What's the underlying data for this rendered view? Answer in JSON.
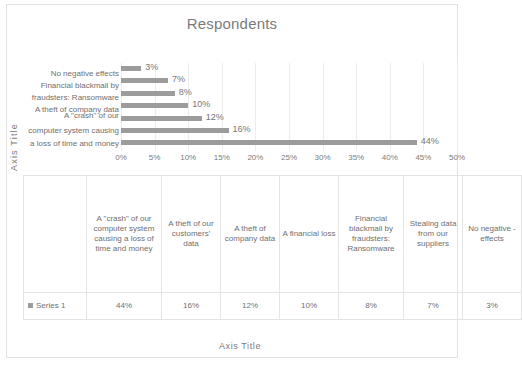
{
  "chart_data": {
    "type": "bar",
    "orientation": "horizontal",
    "title": "Respondents",
    "xlabel": "Axis Title",
    "ylabel": "Axis Title",
    "xlim": [
      0,
      50
    ],
    "grid": true,
    "legend_position": "table-left",
    "series_name": "Series 1",
    "categories": [
      "A \"crash\" of our computer system causing a loss of time and money",
      "A theft of our customers' data",
      "A theft of company data",
      "A financial loss",
      "Financial blackmail by fraudsters: Ransomware",
      "Stealing data from our suppliers",
      "No negative effects"
    ],
    "values": [
      44,
      16,
      12,
      10,
      8,
      7,
      3
    ],
    "value_labels": [
      "44%",
      "16%",
      "12%",
      "10%",
      "8%",
      "7%",
      "3%"
    ],
    "tick_labels": [
      "0%",
      "5%",
      "10%",
      "15%",
      "20%",
      "25%",
      "30%",
      "35%",
      "40%",
      "45%",
      "50%"
    ],
    "tick_values": [
      0,
      5,
      10,
      15,
      20,
      25,
      30,
      35,
      40,
      45,
      50
    ],
    "bar_color": "#9c9c9c",
    "grid_color": "#ededed",
    "text_color": "#6f6f6f"
  },
  "chart": {
    "title": "Respondents",
    "y_axis_title": "Axis Title",
    "x_axis_title": "Axis Title",
    "axis_label_lines": [
      "No negative effects",
      "Financial blackmail by",
      "fraudsters: Ransomware",
      "A theft of company data",
      "A \"crash\" of our",
      "computer system causing",
      "a loss of time and money"
    ],
    "bars": [
      {
        "label": "3%",
        "value": 3
      },
      {
        "label": "7%",
        "value": 7
      },
      {
        "label": "8%",
        "value": 8
      },
      {
        "label": "10%",
        "value": 10
      },
      {
        "label": "12%",
        "value": 12
      },
      {
        "label": "16%",
        "value": 16
      },
      {
        "label": "44%",
        "value": 44
      }
    ],
    "ticks": [
      "0%",
      "5%",
      "10%",
      "15%",
      "20%",
      "25%",
      "30%",
      "35%",
      "40%",
      "45%",
      "50%"
    ]
  },
  "table": {
    "legend_label": "Series 1",
    "headers": [
      "A \"crash\" of our computer system causing a loss of time and money",
      "A theft of our customers' data",
      "A theft of company data",
      "A financial loss",
      "Financial blackmail by fraudsters: Ransomware",
      "Stealing data from our suppliers",
      "No negative -effects"
    ],
    "values": [
      "44%",
      "16%",
      "12%",
      "10%",
      "8%",
      "7%",
      "3%"
    ]
  }
}
